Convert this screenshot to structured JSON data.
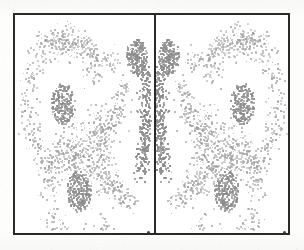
{
  "figure": {
    "title": "",
    "caption": "",
    "frame_color": "#2a2a2a",
    "divider_color": "#2a2a2a",
    "background_color": "#ffffff",
    "dot_color": "#9c9c9c",
    "dot_color_dense": "#8d8d8d",
    "panel_count": 2,
    "panels": [
      {
        "name": "left-panel",
        "label": "",
        "mirrored": false
      },
      {
        "name": "right-panel",
        "label": "",
        "mirrored": true
      }
    ]
  },
  "chart_data": {
    "type": "scatter",
    "title": "",
    "subtitle": "",
    "xlabel": "",
    "ylabel": "",
    "xlim": [
      0,
      1
    ],
    "ylim": [
      0,
      1
    ],
    "xtick_labels": [],
    "ytick_labels": [],
    "grid": false,
    "legend": null,
    "legend_position": "none",
    "annotations": [],
    "marker": {
      "shape": "square",
      "size_px": 2,
      "color": "#9c9c9c"
    },
    "total_points_left_panel": 2100,
    "total_points_right_panel": 2100,
    "series": [
      {
        "name": "density-cluster-mid",
        "kind": "cluster",
        "center": [
          0.34,
          0.6
        ],
        "radius": 0.085,
        "n_points": 240,
        "density": "high"
      },
      {
        "name": "density-cluster-lower",
        "kind": "cluster",
        "center": [
          0.46,
          0.185
        ],
        "radius": 0.085,
        "n_points": 250,
        "density": "high"
      },
      {
        "name": "density-cluster-upper-inner",
        "kind": "cluster",
        "center": [
          0.89,
          0.82
        ],
        "radius": 0.075,
        "n_points": 230,
        "density": "high"
      },
      {
        "name": "ridge-band-outer-upper-loop",
        "kind": "ring",
        "center": [
          0.34,
          0.6
        ],
        "radius": 0.27,
        "thickness": 0.055,
        "n_points": 430,
        "density": "medium",
        "arc_deg": [
          20,
          360
        ]
      },
      {
        "name": "ridge-band-outer-lower-loop",
        "kind": "ring",
        "center": [
          0.46,
          0.185
        ],
        "radius": 0.235,
        "thickness": 0.05,
        "n_points": 400,
        "density": "medium",
        "arc_deg": [
          0,
          330
        ]
      },
      {
        "name": "ridge-band-diagonal-top",
        "kind": "band",
        "from": [
          0.21,
          0.9
        ],
        "to": [
          0.74,
          0.78
        ],
        "thickness": 0.035,
        "n_points": 200,
        "density": "medium"
      },
      {
        "name": "ridge-band-inner-vertical-stripe",
        "kind": "band",
        "from": [
          0.955,
          0.74
        ],
        "to": [
          0.915,
          0.26
        ],
        "thickness": 0.035,
        "n_points": 320,
        "density": "very-high"
      },
      {
        "name": "ridge-band-inner-arc",
        "kind": "band",
        "from": [
          0.8,
          0.68
        ],
        "to": [
          0.6,
          0.4
        ],
        "thickness": 0.04,
        "n_points": 170,
        "density": "medium"
      },
      {
        "name": "ridge-band-lower-sweep",
        "kind": "band",
        "from": [
          0.3,
          0.38
        ],
        "to": [
          0.84,
          0.12
        ],
        "thickness": 0.04,
        "n_points": 230,
        "density": "medium"
      }
    ]
  },
  "axis_ticks": [
    {
      "name": "tick-left-panel",
      "x_pct": 48.5
    },
    {
      "name": "tick-right-panel",
      "x_pct": 98.0
    }
  ]
}
